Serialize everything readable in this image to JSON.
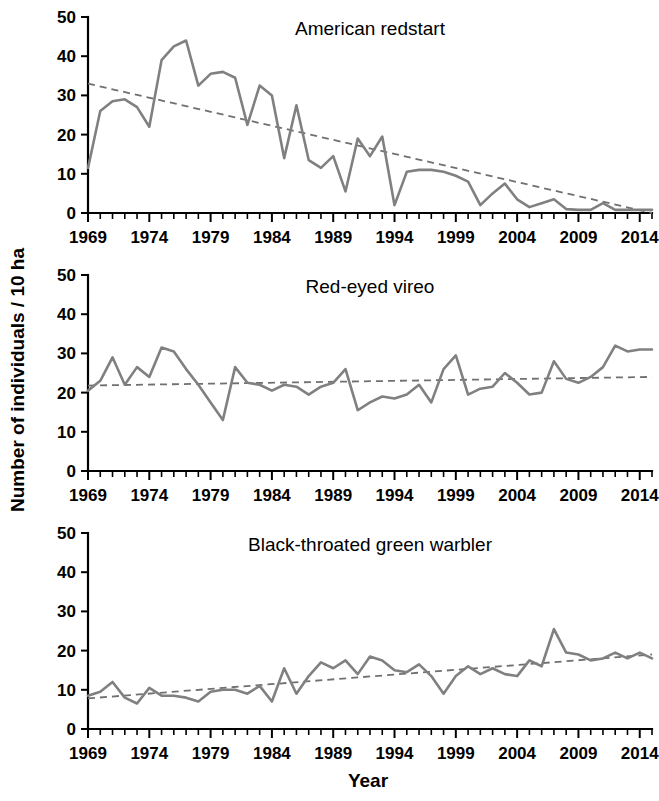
{
  "figure": {
    "ylabel": "Number of individuals / 10 ha",
    "xlabel": "Year",
    "line_color": "#808080",
    "trend_color": "#707070",
    "axis_color": "#000000",
    "background": "#ffffff"
  },
  "chart_data": [
    {
      "type": "line",
      "title": "American redstart",
      "xlabel": "Year",
      "ylabel": "Number of individuals / 10 ha",
      "xlim": [
        1969,
        2015
      ],
      "ylim": [
        0,
        50
      ],
      "yticks": [
        0,
        10,
        20,
        30,
        40,
        50
      ],
      "xticks": [
        1969,
        1974,
        1979,
        1984,
        1989,
        1994,
        1999,
        2004,
        2009,
        2014
      ],
      "grid": false,
      "legend": "none",
      "x": [
        1969,
        1970,
        1971,
        1972,
        1973,
        1974,
        1975,
        1976,
        1977,
        1978,
        1979,
        1980,
        1981,
        1982,
        1983,
        1984,
        1985,
        1986,
        1987,
        1988,
        1989,
        1990,
        1991,
        1992,
        1993,
        1994,
        1995,
        1996,
        1997,
        1998,
        1999,
        2000,
        2001,
        2002,
        2003,
        2004,
        2005,
        2006,
        2007,
        2008,
        2009,
        2010,
        2011,
        2012,
        2013,
        2014,
        2015
      ],
      "series": [
        {
          "name": "American redstart",
          "values": [
            11.5,
            26.0,
            28.5,
            29.0,
            27.0,
            22.0,
            39.0,
            42.5,
            44.0,
            32.5,
            35.5,
            36.0,
            34.5,
            22.5,
            32.5,
            30.0,
            14.0,
            27.5,
            13.5,
            11.5,
            14.5,
            5.5,
            19.0,
            14.5,
            19.5,
            2.0,
            10.5,
            11.0,
            11.0,
            10.5,
            9.5,
            8.0,
            2.0,
            5.0,
            7.5,
            3.5,
            1.5,
            2.5,
            3.5,
            1.0,
            0.8,
            0.8,
            2.5,
            0.8,
            0.8,
            0.8,
            0.8
          ]
        }
      ],
      "trend": {
        "name": "linear trend",
        "start": 33.0,
        "end": 0.0,
        "style": "dashed"
      }
    },
    {
      "type": "line",
      "title": "Red-eyed vireo",
      "xlabel": "Year",
      "ylabel": "Number of individuals / 10 ha",
      "xlim": [
        1969,
        2015
      ],
      "ylim": [
        0,
        50
      ],
      "yticks": [
        0,
        10,
        20,
        30,
        40,
        50
      ],
      "xticks": [
        1969,
        1974,
        1979,
        1984,
        1989,
        1994,
        1999,
        2004,
        2009,
        2014
      ],
      "grid": false,
      "legend": "none",
      "x": [
        1969,
        1970,
        1971,
        1972,
        1973,
        1974,
        1975,
        1976,
        1977,
        1978,
        1979,
        1980,
        1981,
        1982,
        1983,
        1984,
        1985,
        1986,
        1987,
        1988,
        1989,
        1990,
        1991,
        1992,
        1993,
        1994,
        1995,
        1996,
        1997,
        1998,
        1999,
        2000,
        2001,
        2002,
        2003,
        2004,
        2005,
        2006,
        2007,
        2008,
        2009,
        2010,
        2011,
        2012,
        2013,
        2014,
        2015
      ],
      "series": [
        {
          "name": "Red-eyed vireo",
          "values": [
            20.5,
            23.0,
            29.0,
            22.0,
            26.5,
            24.0,
            31.5,
            30.5,
            26.0,
            22.0,
            17.5,
            13.0,
            26.5,
            22.5,
            22.0,
            20.5,
            22.0,
            21.5,
            19.5,
            21.5,
            22.5,
            26.0,
            15.5,
            17.5,
            19.0,
            18.5,
            19.5,
            22.0,
            17.5,
            26.0,
            29.5,
            19.5,
            21.0,
            21.5,
            25.0,
            22.5,
            19.5,
            20.0,
            28.0,
            23.5,
            22.5,
            24.0,
            26.5,
            32.0,
            30.5,
            31.0,
            31.0
          ]
        }
      ],
      "trend": {
        "name": "linear trend",
        "start": 21.8,
        "end": 24.0,
        "style": "dashed"
      }
    },
    {
      "type": "line",
      "title": "Black-throated green warbler",
      "xlabel": "Year",
      "ylabel": "Number of individuals / 10 ha",
      "xlim": [
        1969,
        2015
      ],
      "ylim": [
        0,
        50
      ],
      "yticks": [
        0,
        10,
        20,
        30,
        40,
        50
      ],
      "xticks": [
        1969,
        1974,
        1979,
        1984,
        1989,
        1994,
        1999,
        2004,
        2009,
        2014
      ],
      "grid": false,
      "legend": "none",
      "x": [
        1969,
        1970,
        1971,
        1972,
        1973,
        1974,
        1975,
        1976,
        1977,
        1978,
        1979,
        1980,
        1981,
        1982,
        1983,
        1984,
        1985,
        1986,
        1987,
        1988,
        1989,
        1990,
        1991,
        1992,
        1993,
        1994,
        1995,
        1996,
        1997,
        1998,
        1999,
        2000,
        2001,
        2002,
        2003,
        2004,
        2005,
        2006,
        2007,
        2008,
        2009,
        2010,
        2011,
        2012,
        2013,
        2014,
        2015
      ],
      "series": [
        {
          "name": "Black-throated green warbler",
          "values": [
            8.5,
            9.5,
            12.0,
            8.0,
            6.5,
            10.5,
            8.5,
            8.5,
            8.0,
            7.0,
            9.5,
            10.0,
            10.0,
            9.0,
            11.0,
            7.0,
            15.5,
            9.0,
            13.5,
            17.0,
            15.5,
            17.5,
            14.0,
            18.5,
            17.5,
            15.0,
            14.5,
            16.5,
            13.5,
            9.0,
            13.5,
            16.0,
            14.0,
            15.5,
            14.0,
            13.5,
            17.5,
            16.0,
            25.5,
            19.5,
            19.0,
            17.5,
            18.0,
            19.5,
            18.0,
            19.5,
            18.0
          ]
        }
      ],
      "trend": {
        "name": "linear trend",
        "start": 7.8,
        "end": 19.0,
        "style": "dashed"
      }
    }
  ]
}
